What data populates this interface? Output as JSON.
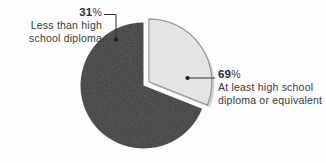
{
  "chart_data": {
    "type": "pie",
    "title": "",
    "categories": [
      "Less than high school diploma",
      "At least high school diploma or equivalent"
    ],
    "values": [
      31,
      69
    ],
    "value_labels": [
      "31%",
      "69%"
    ],
    "units": "percent",
    "legend": "none",
    "grid": false,
    "colors": [
      "#e4e4e4",
      "#3d3d3d"
    ],
    "exploded_slice_index": 0,
    "start_angle_deg": 0,
    "direction": "clockwise",
    "slices": [
      {
        "label": "Less than high school diploma",
        "value": 31,
        "value_text": "31",
        "percent_sign": "%",
        "color": "#e4e4e4",
        "exploded": true
      },
      {
        "label": "At least high school diploma or equivalent",
        "value": 69,
        "value_text": "69",
        "percent_sign": "%",
        "color": "#3d3d3d",
        "exploded": false
      }
    ]
  },
  "labels": {
    "left": {
      "value": "31",
      "sign": "%",
      "line1": "Less than high",
      "line2": "school diploma"
    },
    "right": {
      "value": "69",
      "sign": "%",
      "line1": "At least high school",
      "line2": "diploma or equivalent"
    }
  },
  "style": {
    "background": "#fdfdfd",
    "text_color": "#3a3a3a",
    "leader_color": "#2f2f2f",
    "slice_light": "#e4e4e4",
    "slice_light_border": "#8f8f8f",
    "slice_dark": "#3d3d3d",
    "shadow": "#c9c9c9"
  }
}
